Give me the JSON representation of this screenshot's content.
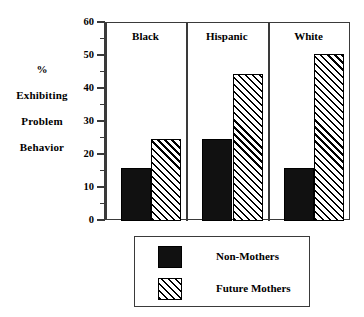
{
  "chart_data": {
    "type": "bar",
    "title": "",
    "xlabel": "",
    "ylabel": "% Exhibiting Problem Behavior",
    "ylim": [
      0,
      60
    ],
    "ytick_step": 10,
    "yminor_step": 5,
    "grid": false,
    "legend_position": "bottom",
    "panel_layout": "grouped-panels",
    "categories": [
      "Black",
      "Hispanic",
      "White"
    ],
    "series": [
      {
        "name": "Non-Mothers",
        "values": [
          16,
          25,
          16
        ],
        "fill": "solid-black"
      },
      {
        "name": "Future Mothers",
        "values": [
          25,
          44.5,
          50.5
        ],
        "fill": "diagonal-hatch"
      }
    ],
    "ytick_labels": [
      "0",
      "10",
      "20",
      "30",
      "40",
      "50",
      "60"
    ],
    "ytick_values": [
      0,
      10,
      20,
      30,
      40,
      50,
      60
    ]
  },
  "axis_title_lines": [
    "%",
    "Exhibiting",
    "Problem",
    "Behavior"
  ],
  "legend": {
    "items": [
      {
        "label": "Non-Mothers",
        "swatch": "solid-black-swatch"
      },
      {
        "label": "Future Mothers",
        "swatch": "hatched-swatch"
      }
    ]
  },
  "colors": {
    "series_non_mothers": "#111111",
    "series_future_mothers": "#ffffff",
    "hatch_line": "#000000",
    "frame": "#3a3a3a",
    "background": "#ffffff",
    "text": "#000000"
  }
}
